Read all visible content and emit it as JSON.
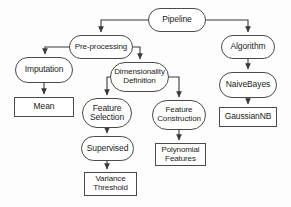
{
  "diagram": {
    "title": "Pipeline",
    "type": "flowchart",
    "orientation": "top-down",
    "style": {
      "background": "#fdfdfd",
      "node_stroke": "#4a4a4a",
      "node_fill": "#ffffff",
      "edge_stroke": "#3a3a3a",
      "text_color": "#1c1c1c"
    },
    "nodes": [
      {
        "id": "pipeline",
        "label": "Pipeline",
        "shape": "stadium",
        "x": 148,
        "y": 8,
        "w": 58,
        "h": 24,
        "font": 8.5
      },
      {
        "id": "pre_processing",
        "label": "Pre-processing",
        "shape": "stadium",
        "x": 69,
        "y": 35,
        "w": 64,
        "h": 24,
        "font": 8.0
      },
      {
        "id": "algorithm",
        "label": "Algorithm",
        "shape": "stadium",
        "x": 221,
        "y": 35,
        "w": 54,
        "h": 24,
        "font": 8.5
      },
      {
        "id": "imputation",
        "label": "Imputation",
        "shape": "stadium",
        "x": 15,
        "y": 57,
        "w": 58,
        "h": 26,
        "font": 8.5
      },
      {
        "id": "dimensionality",
        "label": "Dimensionality\nDefinition",
        "shape": "stadium",
        "x": 110,
        "y": 62,
        "w": 59,
        "h": 30,
        "font": 8.0
      },
      {
        "id": "naive_bayes",
        "label": "NaiveBayes",
        "shape": "stadium",
        "x": 219,
        "y": 72,
        "w": 58,
        "h": 26,
        "font": 8.5
      },
      {
        "id": "mean",
        "label": "Mean",
        "shape": "rect",
        "x": 14,
        "y": 97,
        "w": 60,
        "h": 20,
        "font": 8.5
      },
      {
        "id": "feature_selection",
        "label": "Feature\nSelection",
        "shape": "stadium",
        "x": 82,
        "y": 98,
        "w": 50,
        "h": 30,
        "font": 8.5
      },
      {
        "id": "feature_construction",
        "label": "Feature\nConstruction",
        "shape": "stadium",
        "x": 152,
        "y": 100,
        "w": 54,
        "h": 30,
        "font": 8.0
      },
      {
        "id": "gaussian_nb",
        "label": "GaussianNB",
        "shape": "rect",
        "x": 219,
        "y": 107,
        "w": 58,
        "h": 20,
        "font": 8.5
      },
      {
        "id": "polynomial_features",
        "label": "Polynomial\nFeatures",
        "shape": "rect",
        "x": 155,
        "y": 143,
        "w": 51,
        "h": 23,
        "font": 8.0
      },
      {
        "id": "supervised",
        "label": "Supervised",
        "shape": "stadium",
        "x": 81,
        "y": 136,
        "w": 53,
        "h": 25,
        "font": 8.5
      },
      {
        "id": "variance_threshold",
        "label": "Variance\nThreshold",
        "shape": "rect",
        "x": 84,
        "y": 172,
        "w": 53,
        "h": 24,
        "font": 8.0
      }
    ],
    "edges": [
      {
        "from": "pipeline",
        "to": "pre_processing",
        "label": ""
      },
      {
        "from": "pipeline",
        "to": "algorithm",
        "label": ""
      },
      {
        "from": "pre_processing",
        "to": "imputation",
        "label": ""
      },
      {
        "from": "pre_processing",
        "to": "dimensionality",
        "label": ""
      },
      {
        "from": "imputation",
        "to": "mean",
        "label": ""
      },
      {
        "from": "dimensionality",
        "to": "feature_selection",
        "label": ""
      },
      {
        "from": "dimensionality",
        "to": "feature_construction",
        "label": ""
      },
      {
        "from": "feature_selection",
        "to": "supervised",
        "label": ""
      },
      {
        "from": "supervised",
        "to": "variance_threshold",
        "label": ""
      },
      {
        "from": "feature_construction",
        "to": "polynomial_features",
        "label": ""
      },
      {
        "from": "algorithm",
        "to": "naive_bayes",
        "label": ""
      },
      {
        "from": "naive_bayes",
        "to": "gaussian_nb",
        "label": ""
      }
    ]
  }
}
